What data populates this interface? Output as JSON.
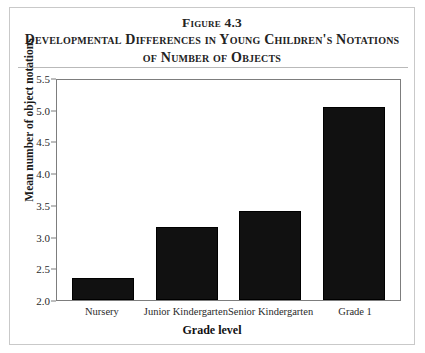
{
  "figure": {
    "title_label": "Figure 4.3",
    "title_line1": "Developmental Differences in Young Children's Notations",
    "title_line2": "of Number of Objects"
  },
  "chart_data": {
    "type": "bar",
    "title": "Developmental Differences in Young Children's Notations of Number of Objects",
    "categories": [
      "Nursery",
      "Junior Kindergarten",
      "Senior Kindergarten",
      "Grade 1"
    ],
    "values": [
      2.35,
      3.15,
      3.4,
      5.05
    ],
    "xlabel": "Grade level",
    "ylabel": "Mean number of object notations",
    "ylim": [
      2.0,
      5.5
    ],
    "ytick_values": [
      5.5,
      5.0,
      4.5,
      4.0,
      3.5,
      3.0,
      2.5,
      2.0
    ],
    "ytick_labels": [
      "5.5",
      "5.0",
      "4.5",
      "4.0",
      "3.5",
      "3.0",
      "2.5",
      "2.0"
    ],
    "grid": false,
    "legend": null,
    "bar_color": "#111111",
    "frame_color": "#7d7d7d",
    "background": "#ffffff"
  }
}
